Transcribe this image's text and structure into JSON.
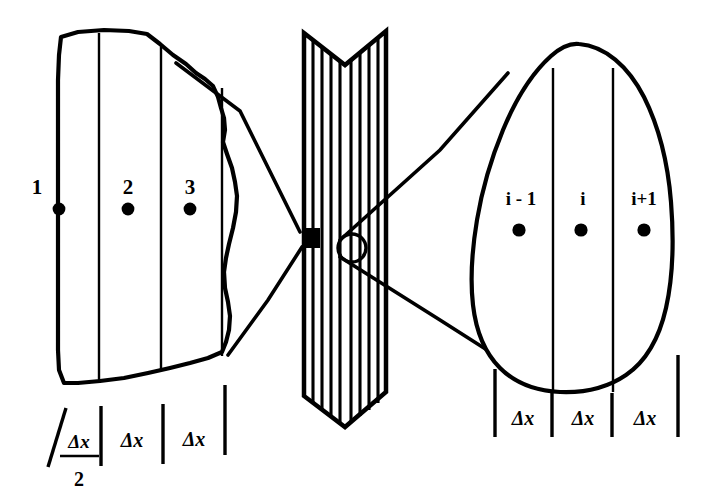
{
  "figure": {
    "background_color": "#ffffff",
    "ink_color": "#000000"
  },
  "left_detail": {
    "name": "boundary-region-detail",
    "nodes": [
      {
        "label": "1",
        "position": "boundary"
      },
      {
        "label": "2",
        "position": "interior"
      },
      {
        "label": "3",
        "position": "interior"
      }
    ],
    "spacings": [
      {
        "label": "Δx",
        "denominator": "2",
        "is_fraction": true
      },
      {
        "label": "Δx",
        "is_fraction": false
      },
      {
        "label": "Δx",
        "is_fraction": false
      }
    ]
  },
  "center_slab": {
    "name": "wall-slab",
    "hatched": true,
    "hatch_count": 9,
    "markers": [
      {
        "name": "boundary-zoom-marker",
        "shape": "square"
      },
      {
        "name": "interior-zoom-marker",
        "shape": "circle"
      }
    ]
  },
  "right_detail": {
    "name": "interior-region-detail",
    "nodes": [
      {
        "label": "i - 1",
        "position": "interior"
      },
      {
        "label": "i",
        "position": "interior"
      },
      {
        "label": "i+1",
        "position": "interior"
      }
    ],
    "spacings": [
      {
        "label": "Δx",
        "is_fraction": false
      },
      {
        "label": "Δx",
        "is_fraction": false
      },
      {
        "label": "Δx",
        "is_fraction": false
      }
    ]
  }
}
